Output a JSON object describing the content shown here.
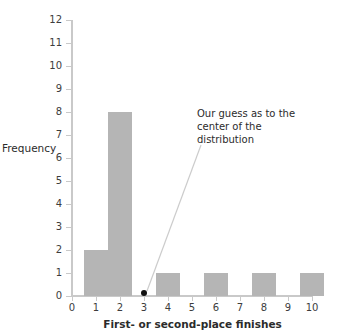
{
  "chart_data": {
    "type": "bar",
    "title": "",
    "subtitle": "",
    "xlabel": "First- or second-place finishes",
    "ylabel": "Frequency",
    "xlim": [
      0,
      10.8
    ],
    "ylim": [
      0,
      12
    ],
    "grid": false,
    "legend": null,
    "x_ticks": [
      "0",
      "1",
      "2",
      "3",
      "4",
      "5",
      "6",
      "7",
      "8",
      "9",
      "10"
    ],
    "x_tick_values": [
      0,
      1,
      2,
      3,
      4,
      5,
      6,
      7,
      8,
      9,
      10
    ],
    "y_ticks": [
      "0",
      "1",
      "2",
      "3",
      "4",
      "5",
      "6",
      "7",
      "8",
      "9",
      "10",
      "11",
      "12"
    ],
    "y_tick_values": [
      0,
      1,
      2,
      3,
      4,
      5,
      6,
      7,
      8,
      9,
      10,
      11,
      12
    ],
    "bar_color": "#b5b5b5",
    "axis_color": "#c9c9c9",
    "bins": [
      {
        "label": "1",
        "x_start": 0.5,
        "x_end": 1.5,
        "value": 2
      },
      {
        "label": "2",
        "x_start": 1.5,
        "x_end": 2.5,
        "value": 8
      },
      {
        "label": "3",
        "x_start": 2.5,
        "x_end": 3.5,
        "value": 0
      },
      {
        "label": "4",
        "x_start": 3.5,
        "x_end": 4.5,
        "value": 1
      },
      {
        "label": "5",
        "x_start": 4.5,
        "x_end": 5.5,
        "value": 0
      },
      {
        "label": "6",
        "x_start": 5.5,
        "x_end": 6.5,
        "value": 1
      },
      {
        "label": "7",
        "x_start": 6.5,
        "x_end": 7.5,
        "value": 0
      },
      {
        "label": "8",
        "x_start": 7.5,
        "x_end": 8.5,
        "value": 1
      },
      {
        "label": "9",
        "x_start": 8.5,
        "x_end": 9.5,
        "value": 0
      },
      {
        "label": "10",
        "x_start": 9.5,
        "x_end": 10.5,
        "value": 1
      }
    ],
    "categories": [
      "1",
      "2",
      "3",
      "4",
      "5",
      "6",
      "7",
      "8",
      "9",
      "10"
    ],
    "values": [
      2,
      8,
      0,
      1,
      0,
      1,
      0,
      1,
      0,
      1
    ],
    "annotations": [
      {
        "name": "center-guess",
        "text": "Our guess as to the center of the distribution",
        "lines": [
          "Our guess as to the",
          "center of the",
          "distribution"
        ],
        "marker": {
          "shape": "circle",
          "color": "#111111",
          "x": 3,
          "y": 0.15
        }
      }
    ]
  }
}
